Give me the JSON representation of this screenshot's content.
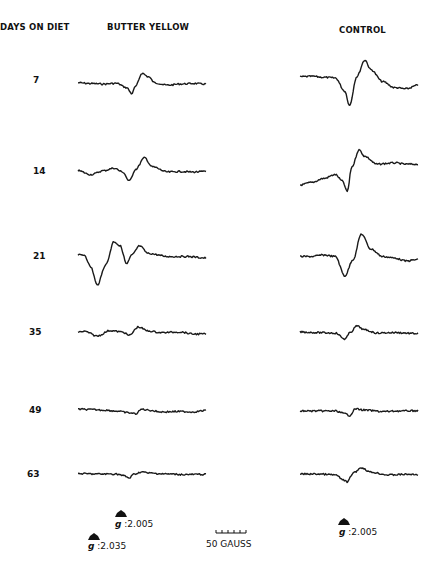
{
  "chart_data": {
    "type": "line",
    "title": "",
    "row_header": "DAYS ON DIET",
    "column_headers": [
      "BUTTER YELLOW",
      "CONTROL"
    ],
    "xlabel": "Magnetic field (scale bar: 50 GAUSS)",
    "ylabel": "",
    "grid": false,
    "rows": [
      {
        "day": "7",
        "butter_yellow": {
          "x": [
            0,
            0.1,
            0.2,
            0.3,
            0.38,
            0.42,
            0.45,
            0.5,
            0.55,
            0.6,
            0.7,
            0.8,
            0.9,
            1.0
          ],
          "y": [
            0.05,
            0.02,
            0.0,
            0.03,
            -0.15,
            -0.4,
            -0.1,
            0.45,
            0.3,
            0.05,
            -0.05,
            0.0,
            0.02,
            0.0
          ]
        },
        "control": {
          "x": [
            0,
            0.1,
            0.2,
            0.3,
            0.38,
            0.42,
            0.48,
            0.55,
            0.6,
            0.7,
            0.8,
            0.9,
            1.0
          ],
          "y": [
            0.3,
            0.32,
            0.28,
            0.25,
            -0.3,
            -0.9,
            0.3,
            1.0,
            0.6,
            0.1,
            -0.15,
            -0.2,
            -0.05
          ]
        }
      },
      {
        "day": "14",
        "butter_yellow": {
          "x": [
            0,
            0.1,
            0.2,
            0.28,
            0.35,
            0.4,
            0.45,
            0.52,
            0.58,
            0.7,
            0.8,
            0.9,
            1.0
          ],
          "y": [
            0.05,
            -0.1,
            0.05,
            0.15,
            0.0,
            -0.35,
            0.1,
            0.55,
            0.2,
            0.0,
            0.02,
            0.0,
            0.02
          ]
        },
        "control": {
          "x": [
            0,
            0.1,
            0.2,
            0.3,
            0.36,
            0.4,
            0.44,
            0.5,
            0.55,
            0.65,
            0.8,
            0.9,
            1.0
          ],
          "y": [
            -0.5,
            -0.4,
            -0.25,
            -0.1,
            -0.35,
            -0.75,
            0.2,
            0.85,
            0.6,
            0.3,
            0.35,
            0.3,
            0.3
          ]
        }
      },
      {
        "day": "21",
        "butter_yellow": {
          "x": [
            0,
            0.05,
            0.1,
            0.15,
            0.22,
            0.28,
            0.33,
            0.38,
            0.42,
            0.48,
            0.55,
            0.7,
            0.85,
            1.0
          ],
          "y": [
            0.1,
            0.1,
            -0.3,
            -0.9,
            -0.2,
            0.55,
            0.4,
            -0.2,
            0.1,
            0.4,
            0.15,
            0.05,
            0.05,
            0.0
          ]
        },
        "control": {
          "x": [
            0,
            0.1,
            0.2,
            0.3,
            0.38,
            0.45,
            0.52,
            0.6,
            0.7,
            0.8,
            0.9,
            1.0
          ],
          "y": [
            0.05,
            0.05,
            0.1,
            0.05,
            -0.6,
            -0.05,
            0.8,
            0.3,
            0.05,
            0.0,
            -0.1,
            -0.05
          ]
        }
      },
      {
        "day": "35",
        "butter_yellow": {
          "x": [
            0,
            0.05,
            0.15,
            0.25,
            0.35,
            0.4,
            0.47,
            0.55,
            0.65,
            0.8,
            0.9,
            1.0
          ],
          "y": [
            0.05,
            0.08,
            -0.15,
            0.12,
            0.05,
            -0.12,
            0.3,
            0.1,
            0.02,
            0.05,
            -0.05,
            -0.05
          ]
        },
        "control": {
          "x": [
            0,
            0.15,
            0.3,
            0.38,
            0.43,
            0.48,
            0.55,
            0.65,
            0.8,
            1.0
          ],
          "y": [
            0.05,
            0.02,
            0.0,
            -0.3,
            0.05,
            0.35,
            0.15,
            0.0,
            0.02,
            -0.03
          ]
        }
      },
      {
        "day": "49",
        "butter_yellow": {
          "x": [
            0,
            0.1,
            0.2,
            0.3,
            0.4,
            0.45,
            0.5,
            0.55,
            0.65,
            0.8,
            0.9,
            1.0
          ],
          "y": [
            0.1,
            0.08,
            0.05,
            0.0,
            -0.1,
            -0.15,
            0.1,
            0.05,
            -0.05,
            -0.03,
            -0.05,
            0.03
          ]
        },
        "control": {
          "x": [
            0,
            0.15,
            0.3,
            0.38,
            0.42,
            0.47,
            0.55,
            0.7,
            0.85,
            1.0
          ],
          "y": [
            0.0,
            0.0,
            0.0,
            -0.15,
            -0.25,
            0.12,
            0.05,
            -0.03,
            0.0,
            0.02
          ]
        }
      },
      {
        "day": "63",
        "butter_yellow": {
          "x": [
            0,
            0.15,
            0.3,
            0.36,
            0.4,
            0.44,
            0.5,
            0.55,
            0.7,
            0.85,
            1.0
          ],
          "y": [
            0.02,
            0.0,
            0.0,
            -0.1,
            -0.22,
            0.0,
            0.12,
            0.05,
            0.0,
            -0.03,
            -0.02
          ]
        },
        "control": {
          "x": [
            0,
            0.15,
            0.3,
            0.36,
            0.4,
            0.45,
            0.52,
            0.6,
            0.75,
            0.9,
            1.0
          ],
          "y": [
            0.0,
            0.0,
            -0.05,
            -0.3,
            -0.45,
            0.05,
            0.35,
            0.1,
            -0.05,
            -0.02,
            -0.03
          ]
        }
      }
    ],
    "markers": [
      {
        "column": "BUTTER YELLOW",
        "label": "g",
        "value": "2.005"
      },
      {
        "column": "BUTTER YELLOW",
        "label": "g",
        "value": "2.035"
      },
      {
        "column": "CONTROL",
        "label": "g",
        "value": "2.005"
      }
    ],
    "scale_bar": "50 GAUSS"
  }
}
